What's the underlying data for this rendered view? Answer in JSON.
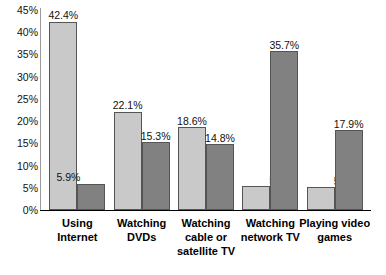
{
  "chart_data": {
    "type": "bar",
    "title": "",
    "subtitle": "",
    "xlabel": "",
    "ylabel": "",
    "ylim": [
      0,
      45
    ],
    "ytick_step": 5,
    "grid": false,
    "legend": "none",
    "value_labels": true,
    "value_suffix": "%",
    "categories": [
      "Using Internet",
      "Watching DVDs",
      "Watching cable or satellite TV",
      "Watching network TV",
      "Playing video games"
    ],
    "category_lines": [
      [
        "Using",
        "Internet"
      ],
      [
        "Watching",
        "DVDs"
      ],
      [
        "Watching",
        "cable or",
        "satellite TV"
      ],
      [
        "Watching",
        "network TV"
      ],
      [
        "Playing video",
        "games"
      ]
    ],
    "yticks": [
      "0%",
      "5%",
      "10%",
      "15%",
      "20%",
      "25%",
      "30%",
      "35%",
      "40%",
      "45%"
    ],
    "ytick_values": [
      0,
      5,
      10,
      15,
      20,
      25,
      30,
      35,
      40,
      45
    ],
    "series": [
      {
        "name": "series-1",
        "color": "#c9c9c9",
        "values": [
          42.4,
          22.1,
          18.6,
          5.3,
          5.1
        ],
        "labels": [
          "42.4%",
          "22.1%",
          "18.6%",
          "5.3%",
          "5.1%"
        ]
      },
      {
        "name": "series-2",
        "color": "#818181",
        "values": [
          5.9,
          15.3,
          14.8,
          35.7,
          17.9
        ],
        "labels": [
          "5.9%",
          "15.3%",
          "14.8%",
          "35.7%",
          "17.9%"
        ]
      }
    ]
  },
  "colors": {
    "series_1": "#c9c9c9",
    "series_2": "#818181",
    "axis": "#000000",
    "text": "#111111",
    "background": "#ffffff"
  }
}
